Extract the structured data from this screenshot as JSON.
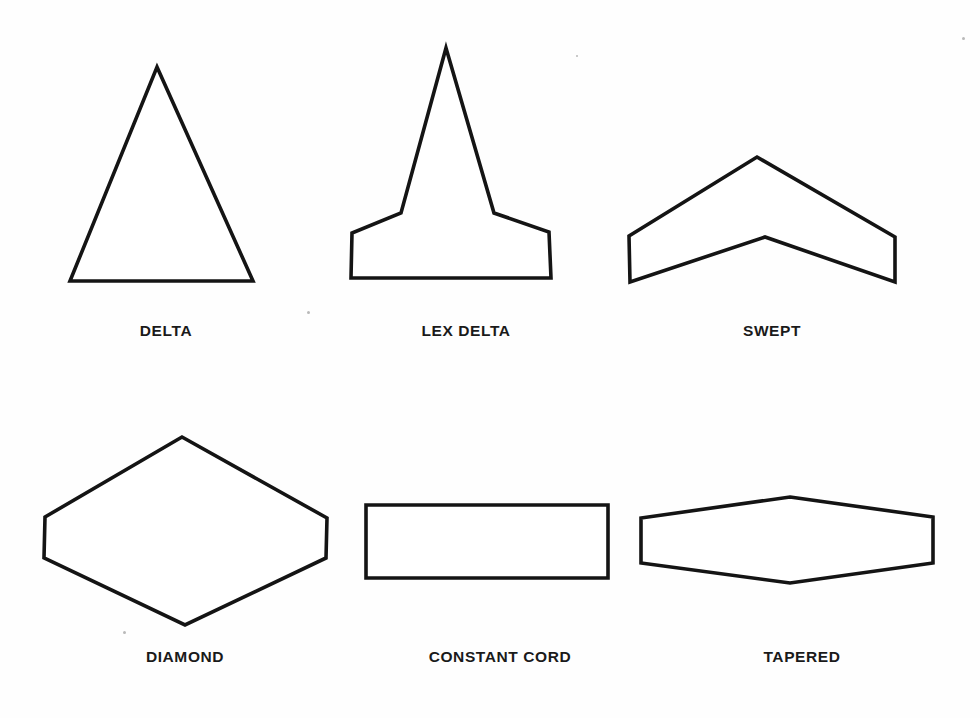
{
  "figure": {
    "kind": "line-diagram",
    "background_color": "#ffffff",
    "line_color": "#141414",
    "label_color": "#1a1a1a",
    "width": 980,
    "height": 718
  },
  "shapes": [
    {
      "id": "delta",
      "label": "DELTA",
      "label_x": 166,
      "label_y": 322,
      "points": "157,67 253,281 70,281"
    },
    {
      "id": "lex-delta",
      "label": "LEX DELTA",
      "label_x": 466,
      "label_y": 322,
      "points": "446,48 494,213 549,232 551,278 351,278 352,233 401,213"
    },
    {
      "id": "swept",
      "label": "SWEPT",
      "label_x": 772,
      "label_y": 322,
      "points": "757,157 895,237 895,282 765,237 630,282 629,236"
    },
    {
      "id": "diamond",
      "label": "DIAMOND",
      "label_x": 185,
      "label_y": 648,
      "points": "182,437 327,518 326,558 185,625 44,558 45,517"
    },
    {
      "id": "constant-cord",
      "label": "CONSTANT CORD",
      "label_x": 500,
      "label_y": 648,
      "points": "366,505 608,505 608,578 366,578"
    },
    {
      "id": "tapered",
      "label": "TAPERED",
      "label_x": 802,
      "label_y": 648,
      "points": "790,497 933,517 933,563 790,583 641,563 641,518"
    }
  ],
  "specks": [
    {
      "x": 307,
      "y": 311,
      "size": 3
    },
    {
      "x": 576,
      "y": 55,
      "size": 2
    },
    {
      "x": 962,
      "y": 37,
      "size": 3
    },
    {
      "x": 123,
      "y": 631,
      "size": 3
    }
  ]
}
